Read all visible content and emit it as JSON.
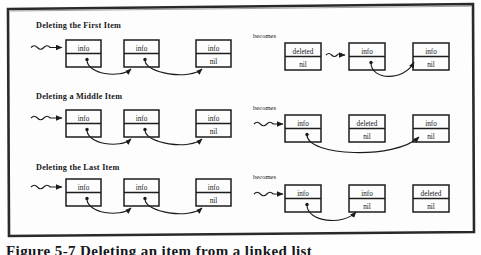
{
  "figure": {
    "frame": {
      "border_color": "#232323",
      "background": "#fdfdfd"
    },
    "caption": "Figure 5-7  Deleting an item from a linked list",
    "becomes_label": "becomes",
    "labels": {
      "info": "info",
      "nil": "nil",
      "deleted": "deleted"
    },
    "rows": [
      {
        "title": "Deleting the First Item",
        "becomes": "becomes",
        "before": {
          "nodes": [
            {
              "top": "info",
              "bottom": "",
              "bottom_kind": "pointer"
            },
            {
              "top": "info",
              "bottom": "",
              "bottom_kind": "pointer"
            },
            {
              "top": "info",
              "bottom": "nil",
              "bottom_kind": "nil"
            }
          ],
          "head_arrow": "squiggle-arrow"
        },
        "after": {
          "nodes": [
            {
              "top": "deleted",
              "bottom": "nil",
              "bottom_kind": "nil"
            },
            {
              "top": "info",
              "bottom": "",
              "bottom_kind": "pointer"
            },
            {
              "top": "info",
              "bottom": "nil",
              "bottom_kind": "nil"
            }
          ],
          "head_arrow": "squiggle-arrow"
        }
      },
      {
        "title": "Deleting a Middle Item",
        "becomes": "becomes",
        "before": {
          "nodes": [
            {
              "top": "info",
              "bottom": "",
              "bottom_kind": "pointer"
            },
            {
              "top": "info",
              "bottom": "",
              "bottom_kind": "pointer"
            },
            {
              "top": "info",
              "bottom": "nil",
              "bottom_kind": "nil"
            }
          ],
          "head_arrow": "squiggle-arrow"
        },
        "after": {
          "nodes": [
            {
              "top": "info",
              "bottom": "",
              "bottom_kind": "pointer"
            },
            {
              "top": "deleted",
              "bottom": "nil",
              "bottom_kind": "nil"
            },
            {
              "top": "info",
              "bottom": "nil",
              "bottom_kind": "nil"
            }
          ],
          "head_arrow": "squiggle-arrow"
        }
      },
      {
        "title": "Deleting the Last Item",
        "becomes": "becomes",
        "before": {
          "nodes": [
            {
              "top": "info",
              "bottom": "",
              "bottom_kind": "pointer"
            },
            {
              "top": "info",
              "bottom": "",
              "bottom_kind": "pointer"
            },
            {
              "top": "info",
              "bottom": "nil",
              "bottom_kind": "nil"
            }
          ],
          "head_arrow": "squiggle-arrow"
        },
        "after": {
          "nodes": [
            {
              "top": "info",
              "bottom": "",
              "bottom_kind": "pointer"
            },
            {
              "top": "info",
              "bottom": "nil",
              "bottom_kind": "nil"
            },
            {
              "top": "deleted",
              "bottom": "nil",
              "bottom_kind": "nil"
            }
          ],
          "head_arrow": "squiggle-arrow"
        }
      }
    ]
  }
}
